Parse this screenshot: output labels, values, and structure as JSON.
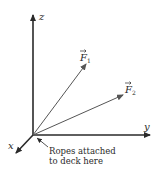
{
  "diagram": {
    "axes": {
      "z": {
        "label": "z"
      },
      "y": {
        "label": "y"
      },
      "x": {
        "label": "x"
      }
    },
    "forces": [
      {
        "symbol": "F",
        "subscript": "1"
      },
      {
        "symbol": "F",
        "subscript": "2"
      }
    ],
    "annotation": {
      "line1": "Ropes attached",
      "line2": "to deck here"
    },
    "colors": {
      "axis": "#2a2a2a",
      "force": "#555555",
      "text": "#2a2a2a"
    }
  }
}
